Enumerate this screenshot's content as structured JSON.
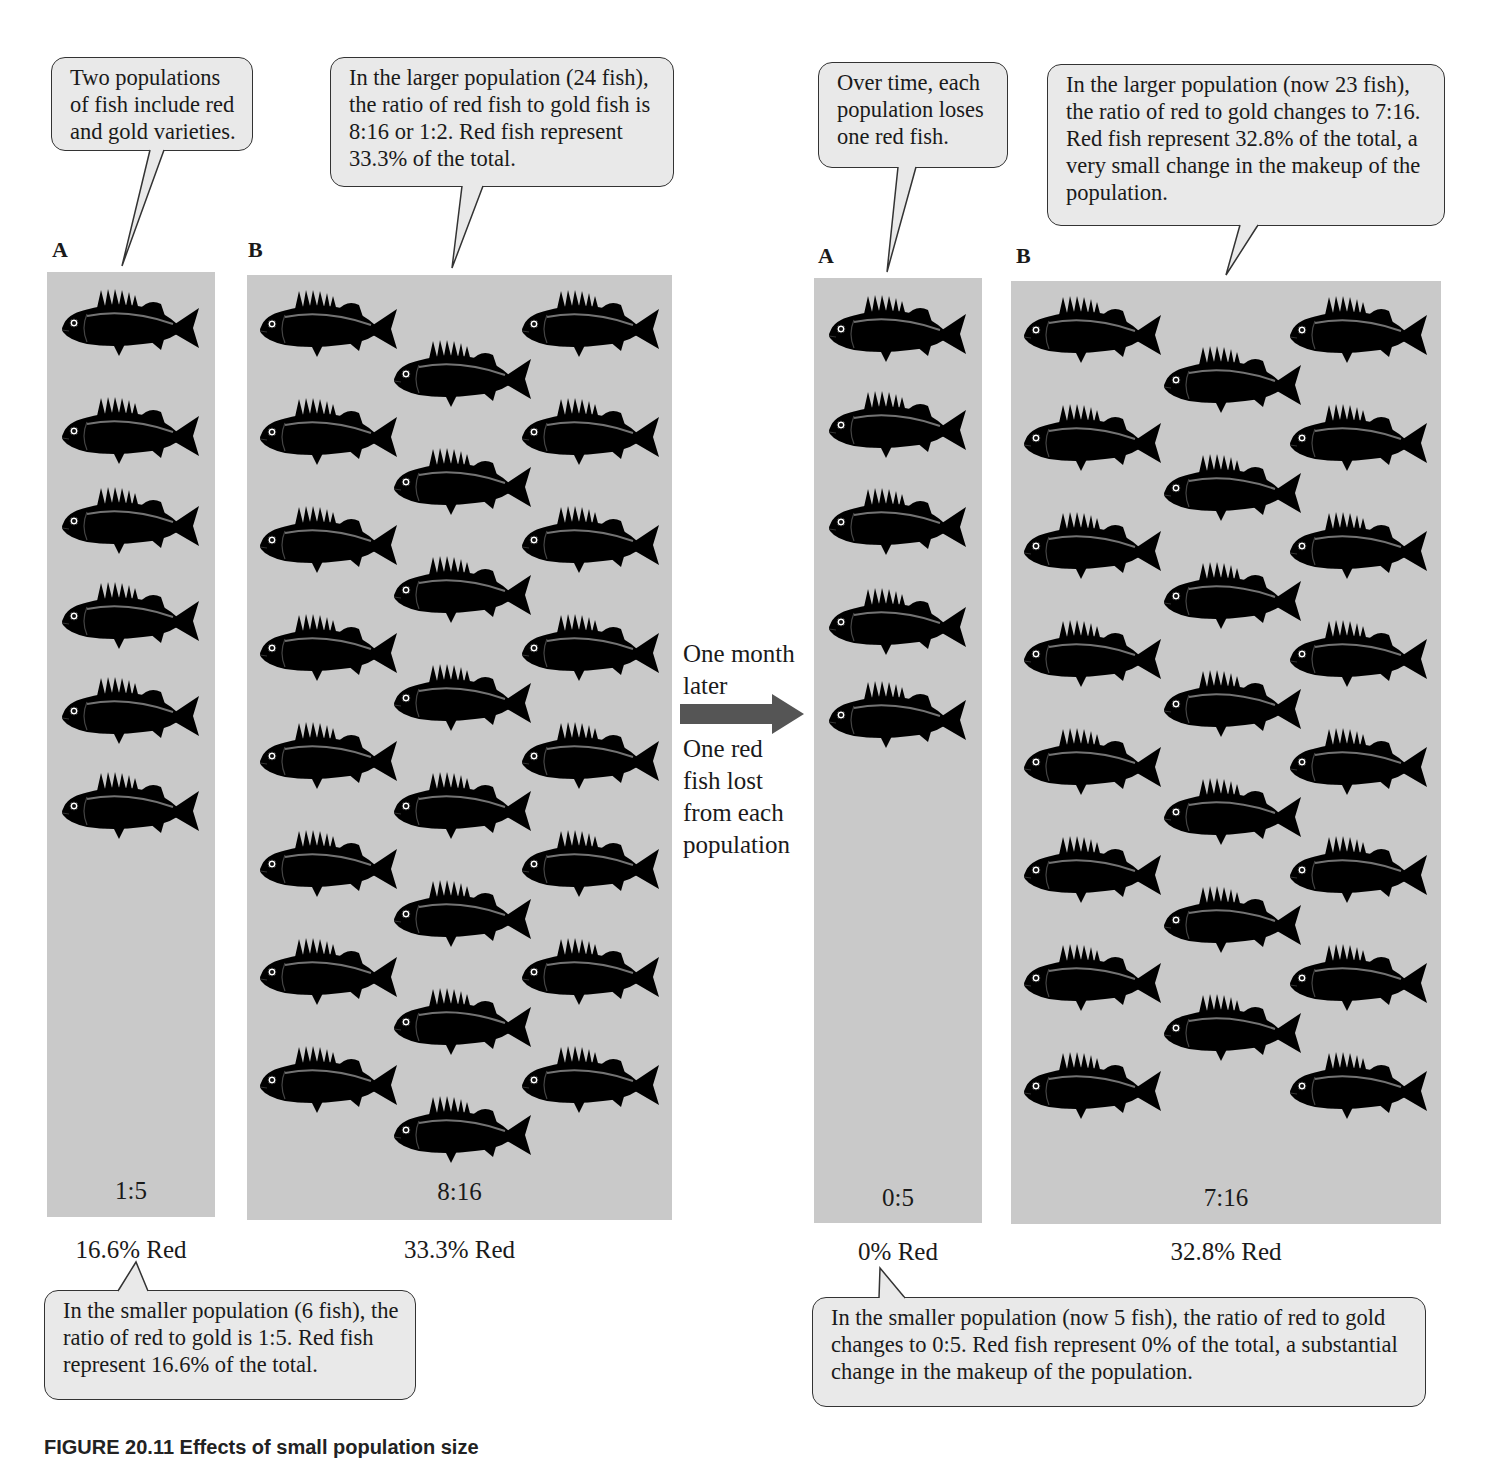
{
  "figure": {
    "caption_partial": "FIGURE 20.11 Effects of small population size",
    "colors": {
      "panel_bg": "#c9c9c9",
      "callout_bg": "#e9e9e9",
      "callout_border": "#333333",
      "arrow": "#555555",
      "text": "#1a1a1a"
    }
  },
  "before": {
    "A": {
      "label": "A",
      "ratio": "1:5",
      "percent": "16.6% Red",
      "red_fish": 1,
      "gold_fish": 5
    },
    "B": {
      "label": "B",
      "ratio": "8:16",
      "percent": "33.3% Red",
      "red_fish": 8,
      "gold_fish": 16
    }
  },
  "after": {
    "A": {
      "label": "A",
      "ratio": "0:5",
      "percent": "0% Red",
      "red_fish": 0,
      "gold_fish": 5
    },
    "B": {
      "label": "B",
      "ratio": "7:16",
      "percent": "32.8% Red",
      "red_fish": 7,
      "gold_fish": 16
    }
  },
  "transition": {
    "top": "One month later",
    "top_lines": [
      "One month",
      "later"
    ],
    "bottom_lines": [
      "One red",
      "fish lost",
      "from each",
      "population"
    ]
  },
  "callouts": {
    "intro": "Two populations of fish include red and gold varieties.",
    "before_large": "In the larger population (24 fish), the ratio of red fish to gold fish is 8:16 or 1:2. Red fish represent 33.3% of the total.",
    "before_small": "In the smaller population (6 fish), the ratio of red to gold is 1:5. Red fish represent 16.6% of the total.",
    "over_time": "Over time, each population loses one red fish.",
    "after_large": "In the larger population (now 23 fish), the ratio of red to gold changes to 7:16. Red fish represent 32.8% of the total, a very small change in the makeup of the population.",
    "after_small": "In the smaller population (now 5 fish), the ratio of red to gold changes to 0:5. Red fish represent 0% of the total, a substantial change in the makeup of the population."
  }
}
